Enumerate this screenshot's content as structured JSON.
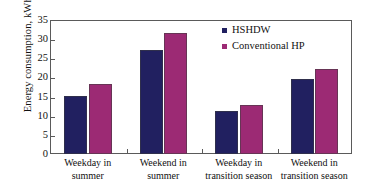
{
  "chart_data": {
    "type": "bar",
    "title": "",
    "xlabel": "",
    "ylabel": "Energy consumption, kWh/day",
    "ylim": [
      0,
      35
    ],
    "yticks": [
      0,
      5,
      10,
      15,
      20,
      25,
      30,
      35
    ],
    "grid": false,
    "legend_position": "top-right",
    "categories": [
      "Weekday in summer",
      "Weekend in summer",
      "Weekday in transition season",
      "Weekend in transition season"
    ],
    "category_lines": [
      {
        "line1": "Weekday in",
        "line2": "summer"
      },
      {
        "line1": "Weekend in",
        "line2": "summer"
      },
      {
        "line1": "Weekday in",
        "line2": "transition season"
      },
      {
        "line1": "Weekend in",
        "line2": "transition season"
      }
    ],
    "series": [
      {
        "name": "HSHDW",
        "color": "#212060",
        "values": [
          15.2,
          27.1,
          11.2,
          19.6
        ]
      },
      {
        "name": "Conventional HP",
        "color": "#9C2A74",
        "values": [
          18.2,
          31.5,
          12.9,
          22.3
        ]
      }
    ]
  },
  "legend": {
    "items": [
      {
        "label": "HSHDW",
        "color": "#212060"
      },
      {
        "label": "Conventional HP",
        "color": "#9C2A74"
      }
    ]
  },
  "axis": {
    "y_title": "Energy consumption, kWh/day",
    "y_tick_labels": [
      "0",
      "5",
      "10",
      "15",
      "20",
      "25",
      "30",
      "35"
    ]
  }
}
